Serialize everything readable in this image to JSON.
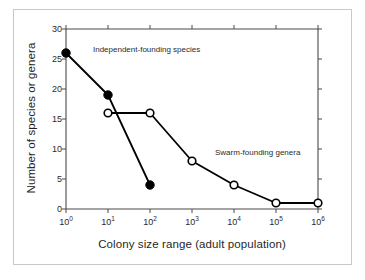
{
  "figure": {
    "background_color": "#ffffff",
    "frame_color": "#c9c9c9",
    "axis_color": "#4a4a4a"
  },
  "chart_data": {
    "type": "line",
    "title": "",
    "xlabel": "Colony size range (adult population)",
    "ylabel": "Number of species or genera",
    "xscale": "log10",
    "xlim": [
      0,
      6
    ],
    "ylim": [
      0,
      30
    ],
    "grid": false,
    "legend_position": "inline-annotations",
    "xtick_labels": [
      "10",
      "10",
      "10",
      "10",
      "10",
      "10",
      "10"
    ],
    "xtick_exponents": [
      "0",
      "1",
      "2",
      "3",
      "4",
      "5",
      "6"
    ],
    "xtick_values": [
      1,
      10,
      100,
      1000,
      10000,
      100000,
      1000000
    ],
    "ytick_labels": [
      "0",
      "5",
      "10",
      "15",
      "20",
      "25",
      "30"
    ],
    "ytick_values": [
      0,
      5,
      10,
      15,
      20,
      25,
      30
    ],
    "series": [
      {
        "name": "Independent-founding species",
        "marker": "filled-circle",
        "color": "#000000",
        "x_exponents": [
          0,
          1,
          2
        ],
        "x": [
          1,
          10,
          100
        ],
        "values": [
          26,
          19,
          4
        ]
      },
      {
        "name": "Swarm-founding genera",
        "marker": "open-circle",
        "color": "#000000",
        "x_exponents": [
          1,
          2,
          3,
          4,
          5,
          6
        ],
        "x": [
          10,
          100,
          1000,
          10000,
          100000,
          1000000
        ],
        "values": [
          16,
          16,
          8,
          4,
          1,
          1
        ]
      }
    ],
    "annotations": [
      {
        "text": "Independent-founding species",
        "x_px": 93,
        "y_px": 50
      },
      {
        "text": "Swarm-founding genera",
        "x_px": 215,
        "y_px": 153
      }
    ]
  }
}
